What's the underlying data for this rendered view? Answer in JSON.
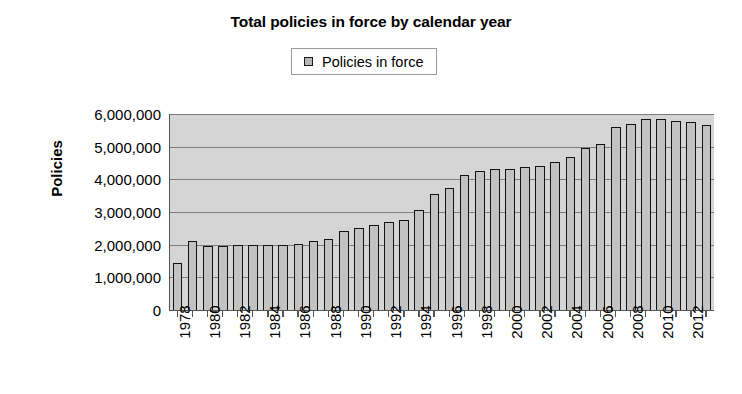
{
  "chart_data": {
    "type": "bar",
    "title": "Total policies in force by calendar year",
    "xlabel": "",
    "ylabel": "Policies",
    "ylim": [
      0,
      6000000
    ],
    "ytick_step": 1000000,
    "ytick_labels": [
      "6,000,000",
      "5,000,000",
      "4,000,000",
      "3,000,000",
      "2,000,000",
      "1,000,000",
      "0"
    ],
    "ytick_values": [
      6000000,
      5000000,
      4000000,
      3000000,
      2000000,
      1000000,
      0
    ],
    "grid": true,
    "legend": {
      "position": "top-center",
      "entries": [
        {
          "label": "Policies in force",
          "swatch_fill": "#b6b6b6",
          "swatch_border": "#1a1a1a"
        }
      ]
    },
    "plot_background": "#d5d5d5",
    "bar_fill": "#c2c2c2",
    "bar_border": "#121212",
    "categories": [
      "1978",
      "1979",
      "1980",
      "1981",
      "1982",
      "1983",
      "1984",
      "1985",
      "1986",
      "1987",
      "1988",
      "1989",
      "1990",
      "1991",
      "1992",
      "1993",
      "1994",
      "1995",
      "1996",
      "1997",
      "1998",
      "1999",
      "2000",
      "2001",
      "2002",
      "2003",
      "2004",
      "2005",
      "2006",
      "2007",
      "2008",
      "2009",
      "2010",
      "2011",
      "2012",
      "2013"
    ],
    "tick_labels_shown": [
      "1978",
      "",
      "1980",
      "",
      "1982",
      "",
      "1984",
      "",
      "1986",
      "",
      "1988",
      "",
      "1990",
      "",
      "1992",
      "",
      "1994",
      "",
      "1996",
      "",
      "1998",
      "",
      "2000",
      "",
      "2002",
      "",
      "2004",
      "",
      "2006",
      "",
      "2008",
      "",
      "2010",
      "",
      "2012",
      ""
    ],
    "values": [
      1440000,
      2100000,
      1960000,
      1950000,
      1980000,
      1980000,
      1980000,
      2000000,
      2020000,
      2100000,
      2180000,
      2430000,
      2520000,
      2600000,
      2680000,
      2760000,
      3050000,
      3550000,
      3750000,
      4130000,
      4270000,
      4330000,
      4310000,
      4370000,
      4420000,
      4520000,
      4670000,
      4960000,
      5090000,
      5600000,
      5680000,
      5840000,
      5840000,
      5790000,
      5760000,
      5650000
    ],
    "series": [
      {
        "name": "Policies in force",
        "values": [
          1440000,
          2100000,
          1960000,
          1950000,
          1980000,
          1980000,
          1980000,
          2000000,
          2020000,
          2100000,
          2180000,
          2430000,
          2520000,
          2600000,
          2680000,
          2760000,
          3050000,
          3550000,
          3750000,
          4130000,
          4270000,
          4330000,
          4310000,
          4370000,
          4420000,
          4520000,
          4670000,
          4960000,
          5090000,
          5600000,
          5680000,
          5840000,
          5840000,
          5790000,
          5760000,
          5650000
        ]
      }
    ]
  }
}
